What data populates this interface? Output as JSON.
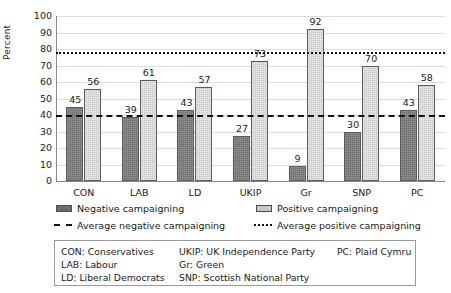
{
  "chart_data": {
    "type": "bar",
    "title": "",
    "xlabel": "",
    "ylabel": "Percent",
    "ylim": [
      0,
      100
    ],
    "ytick_step": 10,
    "yticks": [
      100,
      90,
      80,
      70,
      60,
      50,
      40,
      30,
      20,
      10,
      0
    ],
    "grid": true,
    "legend_position": "below",
    "categories": [
      "CON",
      "LAB",
      "LD",
      "UKIP",
      "Gr",
      "SNP",
      "PC"
    ],
    "series": [
      {
        "name": "Negative campaigning",
        "color": "#6e6e6e",
        "values": [
          45,
          39,
          43,
          27,
          9,
          30,
          43
        ]
      },
      {
        "name": "Positive campaigning",
        "color": "#c9c9c9",
        "values": [
          56,
          61,
          57,
          73,
          92,
          70,
          58
        ]
      }
    ],
    "reference_lines": [
      {
        "name": "Average negative campaigning",
        "value": 40,
        "style": "dashed",
        "color": "#111111"
      },
      {
        "name": "Average positive campaigning",
        "value": 78,
        "style": "dotted",
        "color": "#111111"
      }
    ]
  },
  "legend": {
    "items": [
      {
        "label": "Negative campaigning",
        "marker": "swatch-dark"
      },
      {
        "label": "Positive campaigning",
        "marker": "swatch-light"
      },
      {
        "label": "Average negative campaigning",
        "marker": "line-dashed"
      },
      {
        "label": "Average positive campaigning",
        "marker": "line-dotted"
      }
    ]
  },
  "key_box": {
    "rows": [
      {
        "c1": "CON: Conservatives",
        "c2": "UKIP: UK Independence Party",
        "c3": "PC: Plaid Cymru"
      },
      {
        "c1": "LAB: Labour",
        "c2": "Gr: Green",
        "c3": ""
      },
      {
        "c1": "LD: Liberal Democrats",
        "c2": "SNP: Scottish National Party",
        "c3": ""
      }
    ]
  }
}
